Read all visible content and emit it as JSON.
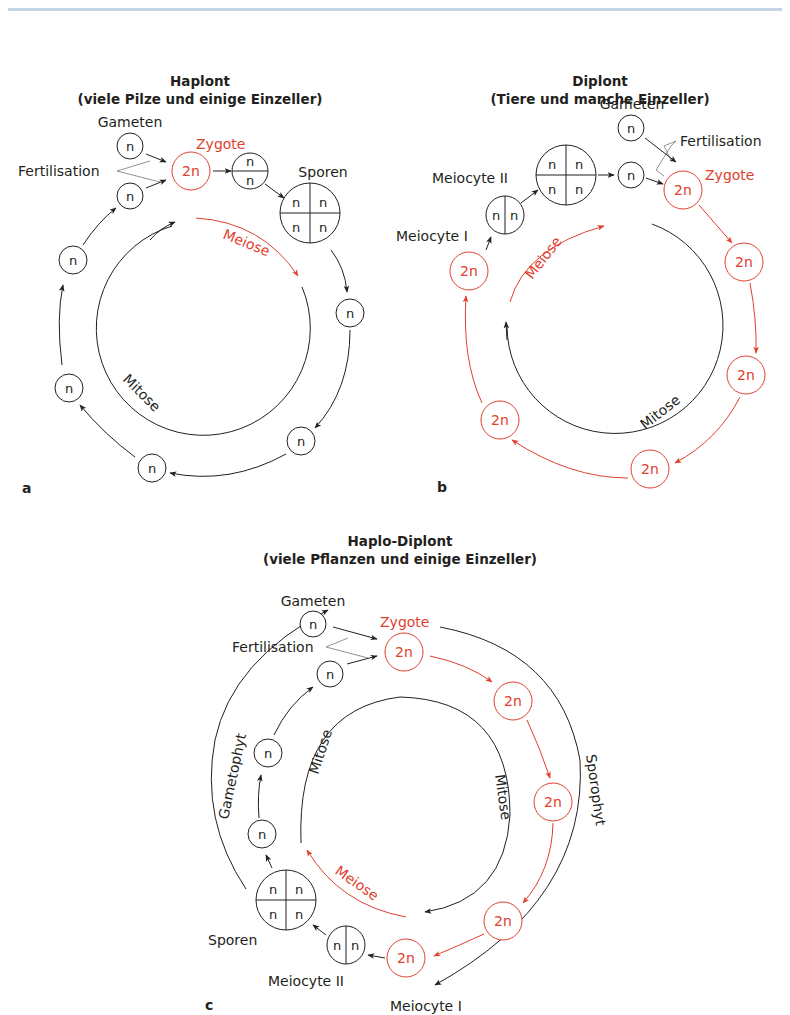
{
  "colors": {
    "black": "#231f20",
    "red": "#e0402e",
    "header_rule": "#c4d3e6"
  },
  "panels": {
    "a": {
      "letter": "a",
      "title_line1": "Haplont",
      "title_line2": "(viele Pilze und einige Einzeller)",
      "labels": {
        "gameten": "Gameten",
        "fertilisation": "Fertilisation",
        "zygote": "Zygote",
        "sporen": "Sporen",
        "meiose": "Meiose",
        "mitose": "Mitose"
      },
      "cells": {
        "gamete_top": "n",
        "gamete_bottom": "n",
        "zygote": "2n",
        "split_top": "n",
        "split_bottom": "n",
        "spore_tl": "n",
        "spore_tr": "n",
        "spore_bl": "n",
        "spore_br": "n",
        "ring_1": "n",
        "ring_2": "n",
        "ring_3": "n",
        "ring_4": "n",
        "ring_5": "n"
      }
    },
    "b": {
      "letter": "b",
      "title_line1": "Diplont",
      "title_line2": "(Tiere und manche Einzeller)",
      "labels": {
        "gameten": "Gameten",
        "fertilisation": "Fertilisation",
        "zygote": "Zygote",
        "meiocyte_1": "Meiocyte I",
        "meiocyte_2": "Meiocyte II",
        "meiose": "Meiose",
        "mitose": "Mitose"
      },
      "cells": {
        "gamete_top": "n",
        "gamete_bottom": "n",
        "zygote": "2n",
        "meiocyte1_left": "n",
        "meiocyte1_right": "n",
        "quad_tl": "n",
        "quad_tr": "n",
        "quad_bl": "n",
        "quad_br": "n",
        "ring_1": "2n",
        "ring_2": "2n",
        "ring_3": "2n",
        "ring_4": "2n",
        "ring_5": "2n",
        "ring_6": "2n"
      }
    },
    "c": {
      "letter": "c",
      "title_line1": "Haplo-Diplont",
      "title_line2": "(viele Pflanzen und einige Einzeller)",
      "labels": {
        "gameten": "Gameten",
        "fertilisation": "Fertilisation",
        "zygote": "Zygote",
        "gametophyt": "Gametophyt",
        "sporophyt": "Sporophyt",
        "mitose_left": "Mitose",
        "mitose_right": "Mitose",
        "meiose": "Meiose",
        "sporen": "Sporen",
        "meiocyte_2": "Meiocyte II",
        "meiocyte_1": "Meiocyte I"
      },
      "cells": {
        "gamete_top": "n",
        "gamete_bottom": "n",
        "zygote": "2n",
        "red_1": "2n",
        "red_2": "2n",
        "red_3": "2n",
        "red_4": "2n",
        "red_5": "2n",
        "meiocyte2_left": "n",
        "meiocyte2_right": "n",
        "spore_tl": "n",
        "spore_tr": "n",
        "spore_bl": "n",
        "spore_br": "n",
        "hap_1": "n",
        "hap_2": "n",
        "hap_3": "n"
      }
    }
  }
}
